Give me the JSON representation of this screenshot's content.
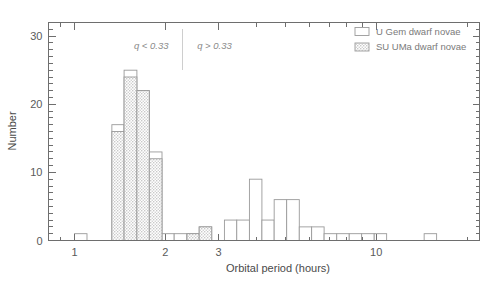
{
  "chart_data": {
    "type": "bar",
    "title": "",
    "subtitle": "",
    "xlabel": "Orbital period (hours)",
    "ylabel": "Number",
    "xscale": "log",
    "yscale": "linear",
    "xlim": [
      0.82,
      22.0
    ],
    "ylim": [
      0,
      32
    ],
    "grid": false,
    "xticks": [
      1,
      2,
      3,
      10
    ],
    "xtick_labels": [
      "1",
      "2",
      "3",
      "10"
    ],
    "yticks": [
      0,
      10,
      20,
      30
    ],
    "ytick_labels": [
      "0",
      "10",
      "20",
      "30"
    ],
    "ytick_minor_step": 1,
    "legend_position": "top-right",
    "legend": [
      {
        "label": "U Gem dwarf novae",
        "style": "open",
        "color": "#ffffff"
      },
      {
        "label": "SU UMa dwarf novae",
        "style": "stippled",
        "color": "#d8d8d8"
      }
    ],
    "annotations": [
      {
        "text": "q < 0.33",
        "x_hours": 2.05,
        "y": 28.5,
        "align": "right"
      },
      {
        "text": "q > 0.33",
        "x_hours": 2.55,
        "y": 28.5,
        "align": "left"
      },
      {
        "text": "divider",
        "x_hours": 2.28,
        "y_from": 25.0,
        "y_to": 31.0
      }
    ],
    "bin_edges_hours": [
      1.0,
      1.1,
      1.21,
      1.33,
      1.46,
      1.61,
      1.77,
      1.95,
      2.14,
      2.36,
      2.59,
      2.85,
      3.14,
      3.45,
      3.8,
      4.18,
      4.59,
      5.05,
      5.56,
      6.11,
      6.72,
      7.4,
      8.14,
      8.95,
      9.85,
      10.83,
      11.91,
      13.11,
      14.42,
      15.86,
      17.44
    ],
    "series": [
      {
        "name": "SU UMa dwarf novae",
        "style": "stippled",
        "values": [
          0,
          0,
          0,
          16,
          24,
          22,
          12,
          0,
          0,
          1,
          2,
          0,
          0,
          0,
          0,
          0,
          0,
          0,
          0,
          0,
          0,
          0,
          0,
          0,
          0,
          0,
          0,
          0,
          0,
          0
        ]
      },
      {
        "name": "U Gem dwarf novae",
        "style": "open",
        "values": [
          1,
          0,
          0,
          17,
          25,
          22,
          13,
          1,
          1,
          1,
          2,
          0,
          3,
          3,
          9,
          3,
          6,
          6,
          2,
          2,
          1,
          1,
          1,
          1,
          1,
          0,
          0,
          0,
          1,
          0
        ]
      }
    ]
  },
  "axes": {
    "ylabel": "Number",
    "xlabel": "Orbital period (hours)"
  }
}
